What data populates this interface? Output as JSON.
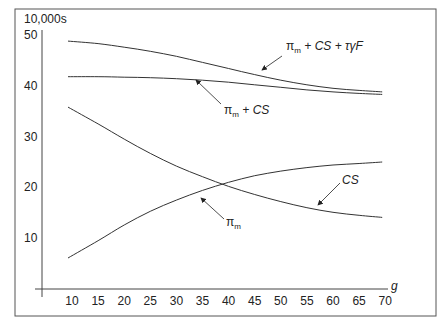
{
  "chart_data": {
    "type": "line",
    "title": "",
    "xlabel": "g",
    "ylabel": "10,000s",
    "xlim": [
      5,
      72
    ],
    "ylim": [
      0,
      50
    ],
    "grid": false,
    "legend": "none (inline arrow annotations)",
    "x": [
      10,
      15,
      20,
      25,
      30,
      35,
      40,
      45,
      50,
      55,
      60,
      65,
      70
    ],
    "x_ticks": [
      "10",
      "15",
      "20",
      "25",
      "30",
      "35",
      "40",
      "45",
      "50",
      "55",
      "60",
      "65",
      "70"
    ],
    "y_ticks": [
      "10",
      "20",
      "30",
      "40",
      "50"
    ],
    "series": [
      {
        "name": "π_m + CS + τγF",
        "values": [
          48.8,
          48.3,
          47.6,
          46.8,
          45.8,
          44.6,
          43.4,
          42.2,
          41.1,
          40.2,
          39.5,
          39.1,
          38.8
        ]
      },
      {
        "name": "π_m + CS",
        "values": [
          41.8,
          41.8,
          41.7,
          41.6,
          41.4,
          41.1,
          40.7,
          40.2,
          39.7,
          39.2,
          38.8,
          38.5,
          38.3
        ]
      },
      {
        "name": "CS",
        "values": [
          35.8,
          32.5,
          29.5,
          26.7,
          24.2,
          22.1,
          20.2,
          18.6,
          17.2,
          16.0,
          15.1,
          14.5,
          14.1
        ]
      },
      {
        "name": "π_m",
        "values": [
          6.1,
          9.5,
          12.6,
          15.3,
          17.5,
          19.4,
          21.0,
          22.3,
          23.2,
          23.9,
          24.4,
          24.7,
          25.0
        ]
      }
    ],
    "annotations": [
      {
        "text": "π_m + CS + τγF",
        "points_to": "top declining curve",
        "at_g": 36
      },
      {
        "text": "π_m + CS",
        "points_to": "flat upper curve",
        "at_g": 35
      },
      {
        "text": "CS",
        "points_to": "declining lower curve",
        "at_g": 56
      },
      {
        "text": "π_m",
        "points_to": "rising curve",
        "at_g": 21
      }
    ]
  },
  "labels": {
    "y_unit": "10,000s",
    "x_var": "g",
    "ann_top_pi": "π",
    "ann_top_sub": "m",
    "ann_top_rest": " + CS + τγF",
    "ann_mid_pi": "π",
    "ann_mid_sub": "m",
    "ann_mid_rest": " + CS",
    "ann_cs": "CS",
    "ann_pi": "π",
    "ann_pi_sub": "m"
  }
}
